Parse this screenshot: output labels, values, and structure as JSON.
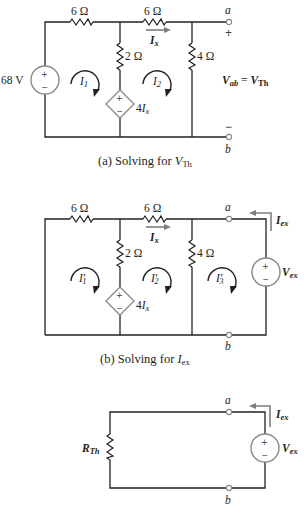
{
  "figure_a": {
    "caption_prefix": "(a) Solving for ",
    "caption_var": "V",
    "caption_sub": "Th",
    "source_label": "68 V",
    "r1_label": "6 Ω",
    "r2_label": "6 Ω",
    "r3_label": "2 Ω",
    "r4_label": "4 Ω",
    "current_arrow": "I",
    "current_arrow_sub": "x",
    "loop1": "I",
    "loop1_sub": "1",
    "loop2": "I",
    "loop2_sub": "2",
    "dep_source_coef": "4",
    "dep_source_var": "I",
    "dep_source_sub": "x",
    "terminal_a": "a",
    "terminal_b": "b",
    "plus_sign": "+",
    "minus_sign": "−",
    "vab_var": "V",
    "vab_sub": "ab",
    "equals": " = ",
    "vth_var": "V",
    "vth_sub": "Th"
  },
  "figure_b": {
    "caption_prefix": "(b) Solving for ",
    "caption_var": "I",
    "caption_sub": "ex",
    "r1_label": "6 Ω",
    "r2_label": "6 Ω",
    "r3_label": "2 Ω",
    "r4_label": "4 Ω",
    "current_arrow": "I",
    "current_arrow_sub": "x",
    "loop1": "I′",
    "loop1_sub": "1",
    "loop2": "I′",
    "loop2_sub": "2",
    "loop3": "I′",
    "loop3_sub": "3",
    "dep_source_coef": "4",
    "dep_source_var": "I",
    "dep_source_sub": "x",
    "terminal_a": "a",
    "terminal_b": "b",
    "iex_var": "I",
    "iex_sub": "ex",
    "vex_var": "V",
    "vex_sub": "ex"
  },
  "figure_c": {
    "rth_var": "R",
    "rth_sub": "Th",
    "terminal_a": "a",
    "terminal_b": "b",
    "iex_var": "I",
    "iex_sub": "ex",
    "vex_var": "V",
    "vex_sub": "ex"
  },
  "symbols": {
    "plus": "+",
    "minus": "−"
  },
  "colors": {
    "wire": "#231f20",
    "source_outline": "#8a8a8a",
    "arrow": "#7d7d7d"
  }
}
